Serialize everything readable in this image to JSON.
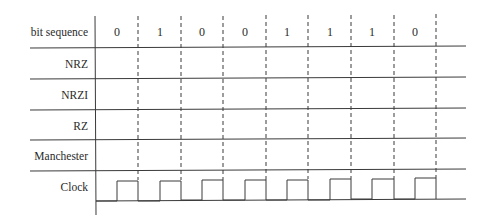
{
  "diagram": {
    "row_labels": [
      "bit sequence",
      "NRZ",
      "NRZI",
      "RZ",
      "Manchester",
      "Clock"
    ],
    "bits": [
      "0",
      "1",
      "0",
      "0",
      "1",
      "1",
      "1",
      "0"
    ],
    "colors": {
      "line": "#3a3a3a",
      "text": "#2a2a2a",
      "background": "#ffffff"
    }
  }
}
